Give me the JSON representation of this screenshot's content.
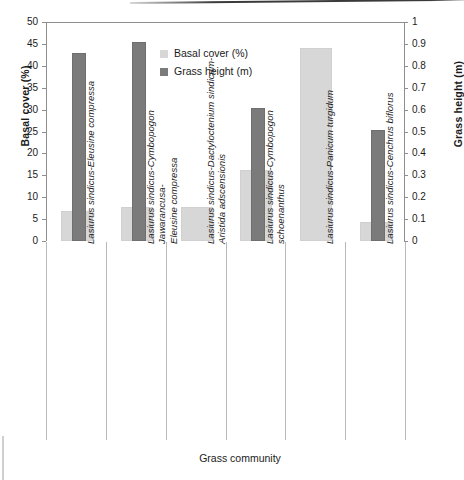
{
  "chart_data": {
    "type": "bar",
    "title": "",
    "xlabel": "Grass community",
    "ylabel": "Basal cover (%)",
    "y2label": "Grass height (m)",
    "ylim": [
      0,
      50
    ],
    "y2lim": [
      0,
      1
    ],
    "grid": false,
    "legend_position": "upper-center-left",
    "categories": [
      "Lasiurus sindicus-Eleusine compressa",
      "Lasiurus sindicus-Cymbopogon Jawarancusa-\nEleusine compressa",
      "Lasiurus sindicus-Dactyloctenium sindicum-\nAristida adscensionis",
      "Lasiurus sindicus-Cymbopogon schoenanthus",
      "Lasiurus sindicus-Panicum turgidum",
      "Lasiurus sindicus-Cenchrus biflorus"
    ],
    "series": [
      {
        "name": "Basal cover (%)",
        "axis": "left",
        "unit": "%",
        "color": "#d7d7d7",
        "values": [
          6.3,
          7.3,
          7.2,
          15.8,
          43.5,
          3.8
        ]
      },
      {
        "name": "Grass height (m)",
        "axis": "right",
        "unit": "m",
        "color": "#7b7b7b",
        "values": [
          0.85,
          0.9,
          null,
          0.6,
          null,
          0.5
        ]
      }
    ],
    "y_ticks": [
      0,
      5,
      10,
      15,
      20,
      25,
      30,
      35,
      40,
      45,
      50
    ],
    "y2_ticks": [
      "0",
      "0.1",
      "0.2",
      "0.3",
      "0.4",
      "0.5",
      "0.6",
      "0.7",
      "0.8",
      "0.9",
      "1"
    ],
    "legend": [
      {
        "label": "Basal cover (%)",
        "color": "#d7d7d7",
        "swatch": "basal"
      },
      {
        "label": "Grass height (m)",
        "color": "#7b7b7b",
        "swatch": "grass"
      }
    ]
  }
}
